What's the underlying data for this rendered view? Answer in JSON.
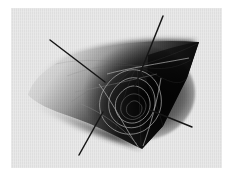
{
  "figure": {
    "title": "",
    "caption": "",
    "background_color": "#eaeaea",
    "page_color": "#ffffff",
    "ink_color": "#161616",
    "contour_color": "#b9b9b9",
    "width_px": 231,
    "height_px": 176
  },
  "chart_data": {
    "type": "surface-3d",
    "title": "",
    "subtitle": "",
    "xlabel": "",
    "ylabel": "",
    "zlabel": "",
    "grid": false,
    "legend": null,
    "legend_position": "none",
    "shading": {
      "model": "grayscale-diffuse",
      "light_direction": "upper-left",
      "highlight_color": "#e3e3e3",
      "shadow_color": "#050505"
    },
    "axes": [
      {
        "name": "axis-1",
        "x1": 39,
        "y1": 32,
        "x2": 94,
        "y2": 74
      },
      {
        "name": "axis-2",
        "x1": 152,
        "y1": 8,
        "x2": 124,
        "y2": 78
      },
      {
        "name": "axis-3",
        "x1": 92,
        "y1": 104,
        "x2": 68,
        "y2": 147
      },
      {
        "name": "axis-4",
        "x1": 139,
        "y1": 102,
        "x2": 181,
        "y2": 119
      }
    ],
    "surface_outline": [
      {
        "x": 17,
        "y": 87
      },
      {
        "x": 38,
        "y": 61
      },
      {
        "x": 72,
        "y": 43
      },
      {
        "x": 113,
        "y": 34
      },
      {
        "x": 152,
        "y": 32
      },
      {
        "x": 187,
        "y": 34
      },
      {
        "x": 174,
        "y": 72
      },
      {
        "x": 152,
        "y": 117
      },
      {
        "x": 131,
        "y": 140
      },
      {
        "x": 104,
        "y": 126
      },
      {
        "x": 72,
        "y": 110
      },
      {
        "x": 40,
        "y": 99
      }
    ],
    "contour_levels": [
      0.2,
      0.35,
      0.5,
      0.65,
      0.8,
      0.95
    ]
  }
}
